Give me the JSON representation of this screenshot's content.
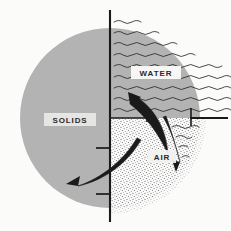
{
  "figure": {
    "background_color": "#fbfbfa",
    "width": 231,
    "height": 231
  },
  "phases": [
    {
      "id": "solids",
      "label": "SOLIDS",
      "fill_color": "#b3b3b3",
      "texture": "solid-gray",
      "label_x": 69,
      "label_y": 121
    },
    {
      "id": "water",
      "label": "WATER",
      "fill_color": "#fbfbfa",
      "texture": "wavy-lines",
      "line_color": "#2a2a2a",
      "label_x": 156,
      "label_y": 74
    },
    {
      "id": "air",
      "label": "AIR",
      "fill_color": "#fbfbfa",
      "texture": "stipple-dots",
      "dot_color": "#6e6e6e",
      "label_x": 161,
      "label_y": 158
    }
  ],
  "axis": {
    "stroke_color": "#1a1a1a",
    "vertical_x": 110,
    "vertical_top_y": 10,
    "vertical_bottom_y": 222,
    "boundary_y": 118,
    "right_end_x": 226
  },
  "arrows": [
    {
      "id": "upper-crescent-arrow",
      "direction": "up-left"
    },
    {
      "id": "lower-crescent-arrow",
      "direction": "down-left"
    },
    {
      "id": "right-wedge-arrow",
      "direction": "down"
    }
  ],
  "colors": {
    "gray_solid": "#b3b3b3",
    "ink": "#1a1a1a",
    "stipple": "#6e6e6e",
    "background": "#fbfbfa"
  }
}
